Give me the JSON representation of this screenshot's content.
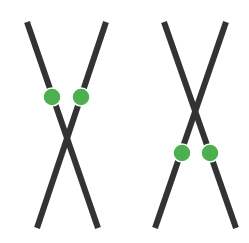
{
  "diagram": {
    "colors": {
      "background": "#ffffff",
      "chromatid": "#333333",
      "marker": "#4caf50",
      "marker_outline": "#ffffff"
    },
    "chromosomes": [
      {
        "id": "left-pair",
        "lines": [
          {
            "x1": 27,
            "y1": 22,
            "x2": 98,
            "y2": 228
          },
          {
            "x1": 106,
            "y1": 22,
            "x2": 37,
            "y2": 228
          }
        ],
        "markers": [
          {
            "cx": 52,
            "cy": 97,
            "r": 9
          },
          {
            "cx": 81,
            "cy": 97,
            "r": 9
          }
        ]
      },
      {
        "id": "right-pair",
        "lines": [
          {
            "x1": 164,
            "y1": 22,
            "x2": 236,
            "y2": 228
          },
          {
            "x1": 226,
            "y1": 22,
            "x2": 155,
            "y2": 228
          }
        ],
        "markers": [
          {
            "cx": 182,
            "cy": 153,
            "r": 9
          },
          {
            "cx": 210,
            "cy": 153,
            "r": 9
          }
        ]
      }
    ]
  }
}
